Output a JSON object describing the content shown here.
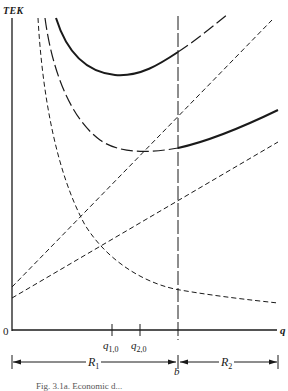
{
  "figure": {
    "y_axis_label": "TEK",
    "x_axis_label": "q",
    "origin_label": "0",
    "ticks": [
      {
        "label": "q",
        "sub": "1,0",
        "x": 112
      },
      {
        "label": "q",
        "sub": "2,0",
        "x": 140
      }
    ],
    "boundary_label": "b",
    "ranges": [
      {
        "label": "R",
        "sub": "1"
      },
      {
        "label": "R",
        "sub": "2"
      }
    ],
    "caption": "Fig. 3.1a. Economic d..."
  },
  "curves": [
    {
      "name": "upper-total-cost-u-curve",
      "style": "solid-then-long-dash"
    },
    {
      "name": "lower-total-cost-u-curve",
      "style": "long-dash-then-solid"
    },
    {
      "name": "upper-linear-cost-line",
      "style": "short-dash"
    },
    {
      "name": "lower-linear-cost-line",
      "style": "short-dash"
    },
    {
      "name": "declining-hyperbola-cost",
      "style": "short-dash"
    },
    {
      "name": "boundary-b-vertical-line",
      "style": "long-dash"
    }
  ],
  "colors": {
    "ink": "#1a1a1a",
    "background": "#ffffff"
  }
}
